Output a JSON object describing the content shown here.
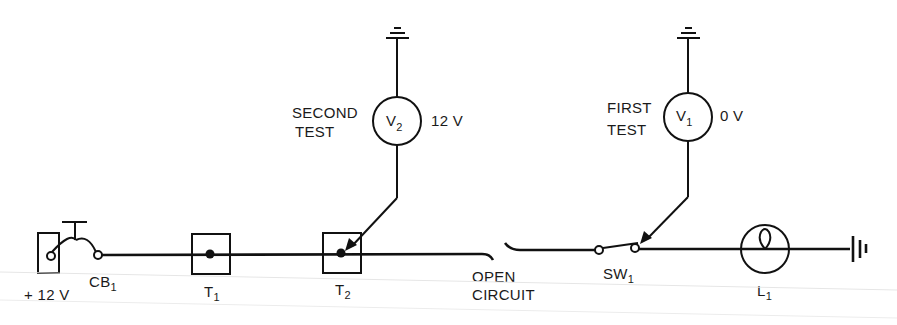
{
  "diagram": {
    "type": "circuit-schematic",
    "source": {
      "label": "+ 12 V"
    },
    "circuit_breaker": {
      "label": "CB",
      "sub": "1"
    },
    "terminals": [
      {
        "label": "T",
        "sub": "1"
      },
      {
        "label": "T",
        "sub": "2"
      }
    ],
    "open_circuit": {
      "line1": "OPEN",
      "line2": "CIRCUIT"
    },
    "switch": {
      "label": "SW",
      "sub": "1"
    },
    "lamp": {
      "label": "L",
      "sub": "1"
    },
    "voltmeters": [
      {
        "id": "V2",
        "letter": "V",
        "sub": "2",
        "test_line1": "SECOND",
        "test_line2": "TEST",
        "reading": "12 V",
        "probe_point": "T2"
      },
      {
        "id": "V1",
        "letter": "V",
        "sub": "1",
        "test_line1": "FIRST",
        "test_line2": "TEST",
        "reading": "0 V",
        "probe_point": "SW1"
      }
    ]
  }
}
